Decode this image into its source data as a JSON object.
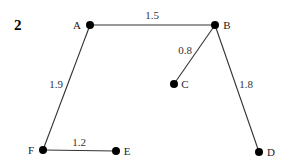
{
  "figure": {
    "number": "2"
  },
  "nodes": [
    {
      "id": "A",
      "label": "A",
      "x": 90,
      "y": 25,
      "lx": 77,
      "ly": 29,
      "anchor": "middle"
    },
    {
      "id": "B",
      "label": "B",
      "x": 215,
      "y": 25,
      "lx": 227,
      "ly": 29,
      "anchor": "middle"
    },
    {
      "id": "C",
      "label": "C",
      "x": 174,
      "y": 84,
      "lx": 185,
      "ly": 88,
      "anchor": "middle"
    },
    {
      "id": "D",
      "label": "D",
      "x": 259,
      "y": 152,
      "lx": 271,
      "ly": 156,
      "anchor": "middle"
    },
    {
      "id": "E",
      "label": "E",
      "x": 116,
      "y": 151,
      "lx": 127,
      "ly": 155,
      "anchor": "middle"
    },
    {
      "id": "F",
      "label": "F",
      "x": 43,
      "y": 150,
      "lx": 31,
      "ly": 154,
      "anchor": "middle"
    }
  ],
  "edges": [
    {
      "from": "A",
      "to": "B",
      "weight": "1.5",
      "lx": 152,
      "ly": 19
    },
    {
      "from": "B",
      "to": "C",
      "weight": "0.8",
      "lx": 185,
      "ly": 54
    },
    {
      "from": "B",
      "to": "D",
      "weight": "1.8",
      "lx": 246,
      "ly": 88
    },
    {
      "from": "A",
      "to": "F",
      "weight": "1.9",
      "lx": 56,
      "ly": 88
    },
    {
      "from": "F",
      "to": "E",
      "weight": "1.2",
      "lx": 79,
      "ly": 146
    }
  ],
  "colors": {
    "edge": "#333333",
    "node": "#000000"
  }
}
